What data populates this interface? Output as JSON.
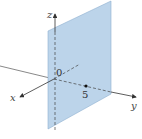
{
  "diagram": {
    "type": "3d-coordinate-plane",
    "axes": {
      "x": {
        "label": "x"
      },
      "y": {
        "label": "y"
      },
      "z": {
        "label": "z"
      }
    },
    "origin_label": "0",
    "point_label": "5",
    "colors": {
      "plane_fill": "#bcd4ea",
      "plane_edge": "#8fb0d0",
      "axis": "#333333",
      "point": "#111111"
    }
  }
}
